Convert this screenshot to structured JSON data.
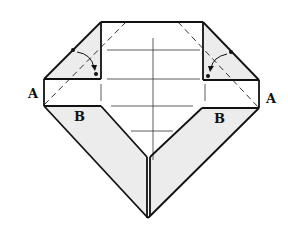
{
  "diagram": {
    "labels": {
      "a_left": "A",
      "a_right": "A",
      "b_left": "B",
      "b_right": "B"
    },
    "colors": {
      "line": "#111111",
      "shade": "#ececec",
      "paper": "#ffffff"
    },
    "annotations": [
      {
        "type": "fold-arrow",
        "side": "left",
        "from": "dot on slanted edge",
        "to": "inner corner dot"
      },
      {
        "type": "fold-arrow",
        "side": "right",
        "from": "dot on slanted edge",
        "to": "inner corner dot"
      }
    ],
    "fold_lines": [
      {
        "type": "valley-dashed",
        "side": "left"
      },
      {
        "type": "valley-dashed",
        "side": "right"
      }
    ]
  }
}
